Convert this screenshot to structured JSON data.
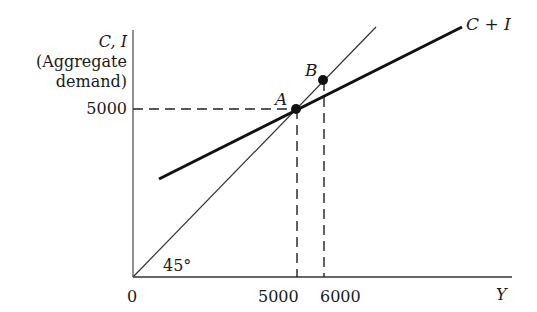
{
  "diagram": {
    "type": "keynesian-cross",
    "y_axis": {
      "label_line1": "C, I",
      "label_line2": "(Aggregate",
      "label_line3": "demand)",
      "tick_5000": "5000"
    },
    "x_axis": {
      "label": "Y",
      "origin": "0",
      "tick_5000": "5000",
      "tick_6000": "6000"
    },
    "lines": {
      "aggregate_demand_label": "C + I",
      "forty_five_label": "45°"
    },
    "points": {
      "a_label": "A",
      "b_label": "B"
    },
    "colors": {
      "ink": "#1a1a1a",
      "background": "#ffffff"
    }
  }
}
